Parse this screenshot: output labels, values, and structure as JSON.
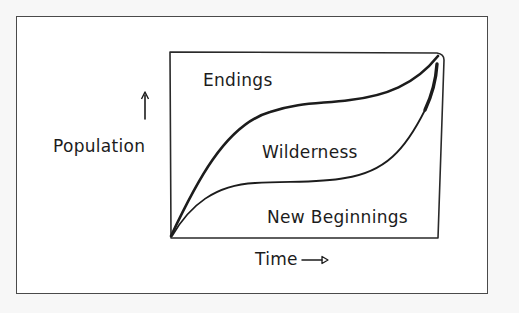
{
  "diagram": {
    "title": "",
    "regions": {
      "top": "Endings",
      "middle": "Wilderness",
      "bottom": "New Beginnings"
    },
    "axes": {
      "y_label": "Population",
      "x_label": "Time",
      "y_arrow": "up-arrow",
      "x_arrow": "right-arrow"
    },
    "curves": [
      {
        "name": "upper-s-curve",
        "description": "thick S-curve from origin rising steeply, plateau, then rising to top-right"
      },
      {
        "name": "lower-s-curve",
        "description": "thinner S-curve from origin, low plateau, then rising steeply to top-right"
      }
    ],
    "colors": {
      "ink": "#1c1c1c",
      "paper": "#ffffff",
      "background": "#f7f7f7",
      "frame": "#4a4a4a"
    }
  }
}
